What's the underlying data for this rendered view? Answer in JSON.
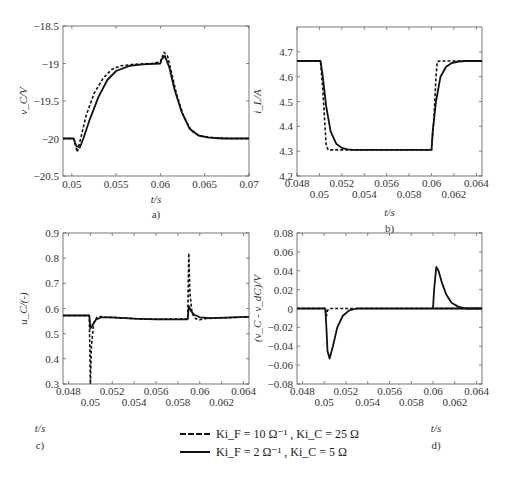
{
  "chart_data": [
    {
      "id": "a",
      "type": "line",
      "panel_label": "a)",
      "xlabel": "t/s",
      "ylabel": "v_C/V",
      "xlim": [
        0.049,
        0.07
      ],
      "ylim": [
        -20.5,
        -18.5
      ],
      "xticks": [
        0.05,
        0.055,
        0.06,
        0.065,
        0.07
      ],
      "xtick_labels": [
        "0.05",
        "0.055",
        "0.06",
        "0.065",
        "0.07"
      ],
      "yticks": [
        -18.5,
        -19,
        -19.5,
        -20,
        -20.5
      ],
      "ytick_labels": [
        "-18.5",
        "-19",
        "-19.5",
        "-20",
        "-20.5"
      ],
      "box": [
        63,
        26,
        249,
        176
      ],
      "series": [
        {
          "name": "Ki_F = 10 Ω^-1, Ki_C = 25 Ω",
          "style": "dashed",
          "x": [
            0.049,
            0.0502,
            0.0506,
            0.051,
            0.0516,
            0.0525,
            0.0535,
            0.0545,
            0.0555,
            0.057,
            0.059,
            0.06,
            0.0604,
            0.0608,
            0.0612,
            0.0618,
            0.0626,
            0.0635,
            0.0645,
            0.066,
            0.068,
            0.07
          ],
          "y": [
            -20,
            -20,
            -20.18,
            -20.0,
            -19.7,
            -19.4,
            -19.2,
            -19.08,
            -19.03,
            -19.01,
            -19.0,
            -18.98,
            -18.85,
            -18.9,
            -19.1,
            -19.4,
            -19.7,
            -19.9,
            -19.97,
            -19.99,
            -20,
            -20
          ]
        },
        {
          "name": "Ki_F = 2 Ω^-1, Ki_C = 5 Ω",
          "style": "solid",
          "x": [
            0.049,
            0.0502,
            0.0505,
            0.0509,
            0.0513,
            0.052,
            0.053,
            0.054,
            0.055,
            0.0565,
            0.058,
            0.06,
            0.0601,
            0.0605,
            0.061,
            0.0616,
            0.0624,
            0.0633,
            0.0643,
            0.0655,
            0.067,
            0.07
          ],
          "y": [
            -20,
            -20,
            -20.1,
            -20.12,
            -20.0,
            -19.75,
            -19.45,
            -19.22,
            -19.1,
            -19.03,
            -19.01,
            -19.0,
            -18.95,
            -18.9,
            -19.05,
            -19.35,
            -19.65,
            -19.87,
            -19.96,
            -19.99,
            -20,
            -20
          ]
        }
      ]
    },
    {
      "id": "b",
      "type": "line",
      "panel_label": "b)",
      "xlabel": "t/s",
      "ylabel": "i_L/A",
      "xlim": [
        0.048,
        0.0645
      ],
      "ylim": [
        4.2,
        4.8
      ],
      "xticks": [
        0.048,
        0.05,
        0.052,
        0.054,
        0.056,
        0.058,
        0.06,
        0.062,
        0.064
      ],
      "xtick_labels": [
        "0.048",
        "0.05",
        "0.052",
        "0.054",
        "0.056",
        "0.058",
        "0.06",
        "0.062",
        "0.064"
      ],
      "yticks": [
        4.2,
        4.3,
        4.4,
        4.5,
        4.6,
        4.7
      ],
      "ytick_labels": [
        "4.2",
        "4.3",
        "4.4",
        "4.5",
        "4.6",
        "4.7"
      ],
      "box": [
        297,
        27,
        482,
        176
      ],
      "series": [
        {
          "name": "Ki_F = 10 Ω^-1, Ki_C = 25 Ω",
          "style": "dashed",
          "x": [
            0.048,
            0.0501,
            0.0503,
            0.0505,
            0.0506,
            0.0508,
            0.06,
            0.0602,
            0.0604,
            0.0605,
            0.0607,
            0.0645
          ],
          "y": [
            4.663,
            4.663,
            4.55,
            4.4,
            4.32,
            4.305,
            4.305,
            4.42,
            4.6,
            4.66,
            4.663,
            4.663
          ]
        },
        {
          "name": "Ki_F = 2 Ω^-1, Ki_C = 5 Ω",
          "style": "solid",
          "x": [
            0.048,
            0.0501,
            0.0503,
            0.0506,
            0.051,
            0.0515,
            0.052,
            0.0525,
            0.053,
            0.06,
            0.0601,
            0.0604,
            0.0608,
            0.0613,
            0.0618,
            0.0624,
            0.063,
            0.0645
          ],
          "y": [
            4.663,
            4.663,
            4.6,
            4.48,
            4.38,
            4.33,
            4.313,
            4.307,
            4.305,
            4.305,
            4.38,
            4.5,
            4.6,
            4.64,
            4.655,
            4.661,
            4.663,
            4.663
          ]
        }
      ]
    },
    {
      "id": "c",
      "type": "line",
      "panel_label": "c)",
      "xlabel": "t/s",
      "ylabel": "u_C/(-)",
      "xlim": [
        0.0475,
        0.0645
      ],
      "ylim": [
        0.3,
        0.9
      ],
      "xticks": [
        0.048,
        0.05,
        0.052,
        0.054,
        0.056,
        0.058,
        0.06,
        0.062,
        0.064
      ],
      "xtick_labels": [
        "0.048",
        "0.05",
        "0.052",
        "0.054",
        "0.056",
        "0.058",
        "0.06",
        "0.062",
        "0.064"
      ],
      "yticks": [
        0.3,
        0.4,
        0.5,
        0.6,
        0.7,
        0.8,
        0.9
      ],
      "ytick_labels": [
        "0.3",
        "0.4",
        "0.5",
        "0.6",
        "0.7",
        "0.8",
        "0.9"
      ],
      "box": [
        63,
        233,
        249,
        384
      ],
      "series": [
        {
          "name": "Ki_F = 10 Ω^-1, Ki_C = 25 Ω",
          "style": "dashed",
          "x": [
            0.0475,
            0.0499,
            0.05,
            0.0501,
            0.0503,
            0.0506,
            0.051,
            0.0515,
            0.055,
            0.0589,
            0.059,
            0.0591,
            0.0593,
            0.0596,
            0.06,
            0.0605,
            0.0645
          ],
          "y": [
            0.572,
            0.572,
            0.3,
            0.45,
            0.54,
            0.565,
            0.568,
            0.565,
            0.558,
            0.558,
            0.82,
            0.66,
            0.58,
            0.56,
            0.555,
            0.56,
            0.567
          ]
        },
        {
          "name": "Ki_F = 2 Ω^-1, Ki_C = 5 Ω",
          "style": "solid",
          "x": [
            0.0475,
            0.0499,
            0.05,
            0.0502,
            0.0505,
            0.051,
            0.052,
            0.054,
            0.056,
            0.0589,
            0.059,
            0.0592,
            0.0595,
            0.06,
            0.061,
            0.0645
          ],
          "y": [
            0.572,
            0.572,
            0.52,
            0.535,
            0.555,
            0.565,
            0.565,
            0.56,
            0.557,
            0.557,
            0.61,
            0.59,
            0.575,
            0.565,
            0.562,
            0.567
          ]
        }
      ]
    },
    {
      "id": "d",
      "type": "line",
      "panel_label": "d)",
      "xlabel": "t/s",
      "ylabel": "(v_C - v_dC)/V",
      "xlim": [
        0.0475,
        0.0645
      ],
      "ylim": [
        -0.08,
        0.08
      ],
      "xticks": [
        0.048,
        0.05,
        0.052,
        0.054,
        0.056,
        0.058,
        0.06,
        0.062,
        0.064
      ],
      "xtick_labels": [
        "0.048",
        "0.05",
        "0.052",
        "0.054",
        "0.056",
        "0.058",
        "0.06",
        "0.062",
        "0.064"
      ],
      "yticks": [
        -0.08,
        -0.06,
        -0.04,
        -0.02,
        0,
        0.02,
        0.04,
        0.06,
        0.08
      ],
      "ytick_labels": [
        "-0.08",
        "-0.06",
        "-0.04",
        "-0.02",
        "0",
        "0.02",
        "0.04",
        "0.06",
        "0.08"
      ],
      "box": [
        297,
        233,
        482,
        384
      ],
      "series": [
        {
          "name": "Ki_F = 10 Ω^-1, Ki_C = 25 Ω",
          "style": "dashed",
          "x": [
            0.0475,
            0.0501,
            0.0502,
            0.0503,
            0.0505,
            0.0645
          ],
          "y": [
            0,
            0,
            -0.008,
            -0.002,
            0,
            0
          ]
        },
        {
          "name": "Ki_F = 2 Ω^-1, Ki_C = 5 Ω",
          "style": "solid",
          "x": [
            0.0475,
            0.0501,
            0.0502,
            0.0503,
            0.0505,
            0.0508,
            0.0512,
            0.0517,
            0.0523,
            0.053,
            0.0645
          ],
          "y": [
            0,
            0,
            -0.02,
            -0.045,
            -0.053,
            -0.04,
            -0.02,
            -0.008,
            -0.002,
            0,
            0
          ]
        },
        {
          "name": "Ki_F = 2 Ω^-1, Ki_C = 5 Ω (second transient)",
          "style": "solid",
          "x": [
            0.06,
            0.0601,
            0.0603,
            0.0605,
            0.0608,
            0.0612,
            0.0617,
            0.0623,
            0.063,
            0.0645
          ],
          "y": [
            0,
            0.02,
            0.044,
            0.04,
            0.028,
            0.015,
            0.006,
            0.002,
            0,
            0
          ]
        }
      ]
    }
  ],
  "legend": {
    "entries": [
      {
        "style": "dashed",
        "label": "Ki_F = 10 Ω⁻¹ , Ki_C = 25 Ω"
      },
      {
        "style": "solid",
        "label": "Ki_F = 2 Ω⁻¹ , Ki_C = 5 Ω"
      }
    ]
  }
}
